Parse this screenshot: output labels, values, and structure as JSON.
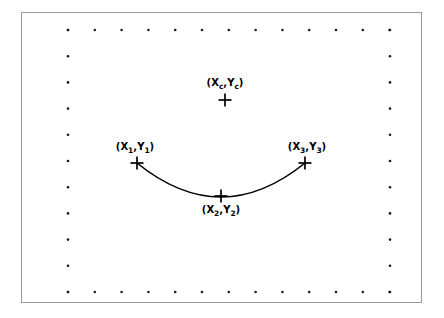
{
  "figure": {
    "background_color": "#ffffff",
    "frame": {
      "border_color": "#9a9a9a",
      "x": 21,
      "y": 12,
      "width": 401,
      "height": 291
    },
    "stroke_color": "#000000"
  },
  "labels": {
    "center": {
      "prefix": "(X",
      "sub1": "c",
      "mid": ",Y",
      "sub2": "c",
      "suffix": ")"
    },
    "p1": {
      "prefix": "(X",
      "sub1": "1",
      "mid": ",Y",
      "sub2": "1",
      "suffix": ")"
    },
    "p2": {
      "prefix": "(X",
      "sub1": "2",
      "mid": ",Y",
      "sub2": "2",
      "suffix": ")"
    },
    "p3": {
      "prefix": "(X",
      "sub1": "3",
      "mid": ",Y",
      "sub2": "3",
      "suffix": ")"
    }
  },
  "chart_data": {
    "type": "scatter",
    "title": "",
    "xlabel": "",
    "ylabel": "",
    "grid": true,
    "grid_style": "dotted-border-ticks",
    "legend": "none",
    "xlim": [
      21,
      422
    ],
    "ylim": [
      12,
      303
    ],
    "markers": [
      {
        "name": "center",
        "label": "(Xc,Yc)",
        "x": 225,
        "y": 100,
        "marker": "plus",
        "size": 13
      },
      {
        "name": "p1",
        "label": "(X1,Y1)",
        "x": 137,
        "y": 163,
        "marker": "plus",
        "size": 13
      },
      {
        "name": "p2",
        "label": "(X2,Y2)",
        "x": 221,
        "y": 196,
        "marker": "plus",
        "size": 13
      },
      {
        "name": "p3",
        "label": "(X3,Y3)",
        "x": 305,
        "y": 163,
        "marker": "plus",
        "size": 13
      }
    ],
    "series": [
      {
        "name": "arc",
        "type": "arc",
        "stroke": "#000000",
        "stroke_width": 1.6,
        "path": "M 137 163 Q 221 231 305 163",
        "through_points": [
          [
            137,
            163
          ],
          [
            221,
            196
          ],
          [
            305,
            163
          ]
        ]
      }
    ],
    "tick_dots": {
      "color": "#1a1a1a",
      "radius": 1.3,
      "top_row": {
        "y": 30,
        "x_start": 68,
        "x_step": 26.8,
        "count": 13
      },
      "bottom_row": {
        "y": 292,
        "x_start": 68,
        "x_step": 26.8,
        "count": 13
      },
      "left_column": {
        "x": 68,
        "y_start": 30,
        "y_step": 26.2,
        "count": 11
      },
      "right_column": {
        "x": 390,
        "y_start": 30,
        "y_step": 26.2,
        "count": 11
      }
    }
  }
}
